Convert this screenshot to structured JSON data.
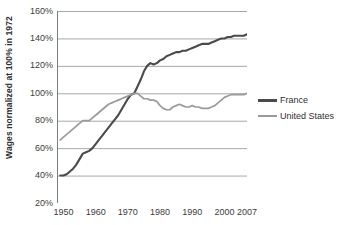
{
  "chart_data": {
    "type": "line",
    "title": "",
    "xlabel": "",
    "ylabel": "Wages normalized at 100% in 1972",
    "xlim": [
      1948,
      2007
    ],
    "ylim": [
      20,
      160
    ],
    "ytick_labels": [
      "160%",
      "140%",
      "120%",
      "100%",
      "80%",
      "60%",
      "40%",
      "20%"
    ],
    "ytick_values": [
      160,
      140,
      120,
      100,
      80,
      60,
      40,
      20
    ],
    "xtick_labels": [
      "1950",
      "1960",
      "1970",
      "1980",
      "1990",
      "2000",
      "2007"
    ],
    "xtick_values": [
      1950,
      1960,
      1970,
      1980,
      1990,
      2000,
      2007
    ],
    "grid": "horizontal",
    "legend_position": "right",
    "colors": {
      "france": "#4a4a4a",
      "united_states": "#9a9a9a",
      "gridline": "#a8a8a8",
      "axis": "#7d7d7d",
      "text": "#3c3c3c"
    },
    "series": [
      {
        "name": "France",
        "color": "#4a4a4a",
        "x": [
          1949,
          1950,
          1951,
          1952,
          1953,
          1954,
          1955,
          1956,
          1957,
          1958,
          1959,
          1960,
          1961,
          1962,
          1963,
          1964,
          1965,
          1966,
          1967,
          1968,
          1969,
          1970,
          1971,
          1972,
          1973,
          1974,
          1975,
          1976,
          1977,
          1978,
          1979,
          1980,
          1981,
          1982,
          1983,
          1984,
          1985,
          1986,
          1987,
          1988,
          1989,
          1990,
          1991,
          1992,
          1993,
          1994,
          1995,
          1996,
          1997,
          1998,
          1999,
          2000,
          2001,
          2002,
          2003,
          2004,
          2005,
          2006,
          2007
        ],
        "values": [
          40,
          40,
          41,
          43,
          45,
          48,
          52,
          56,
          57,
          58,
          60,
          63,
          66,
          69,
          72,
          75,
          78,
          81,
          84,
          88,
          92,
          96,
          99,
          100,
          105,
          110,
          116,
          120,
          122,
          121,
          122,
          124,
          125,
          127,
          128,
          129,
          130,
          130,
          131,
          131,
          132,
          133,
          134,
          135,
          136,
          136,
          136,
          137,
          138,
          139,
          140,
          140,
          141,
          141,
          142,
          142,
          142,
          142,
          143
        ]
      },
      {
        "name": "United States",
        "color": "#9a9a9a",
        "x": [
          1949,
          1950,
          1951,
          1952,
          1953,
          1954,
          1955,
          1956,
          1957,
          1958,
          1959,
          1960,
          1961,
          1962,
          1963,
          1964,
          1965,
          1966,
          1967,
          1968,
          1969,
          1970,
          1971,
          1972,
          1973,
          1974,
          1975,
          1976,
          1977,
          1978,
          1979,
          1980,
          1981,
          1982,
          1983,
          1984,
          1985,
          1986,
          1987,
          1988,
          1989,
          1990,
          1991,
          1992,
          1993,
          1994,
          1995,
          1996,
          1997,
          1998,
          1999,
          2000,
          2001,
          2002,
          2003,
          2004,
          2005,
          2006,
          2007
        ],
        "values": [
          66,
          68,
          70,
          72,
          74,
          76,
          78,
          80,
          80,
          80,
          82,
          84,
          86,
          88,
          90,
          92,
          93,
          94,
          95,
          96,
          97,
          98,
          99,
          100,
          100,
          98,
          96,
          96,
          95,
          95,
          94,
          91,
          89,
          88,
          88,
          90,
          91,
          92,
          91,
          90,
          90,
          91,
          90,
          90,
          89,
          89,
          89,
          90,
          91,
          93,
          95,
          97,
          98,
          99,
          99,
          99,
          99,
          99,
          100
        ]
      }
    ]
  },
  "legend": {
    "items": [
      {
        "label": "France",
        "color": "#4a4a4a"
      },
      {
        "label": "United States",
        "color": "#9a9a9a"
      }
    ]
  }
}
